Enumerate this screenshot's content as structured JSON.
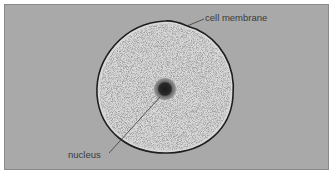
{
  "diagram": {
    "type": "labeled-cell",
    "background_color": "#a9a9a9",
    "cytoplasm_color": "#d8d8d8",
    "labels": {
      "membrane": "cell membrane",
      "nucleus": "nucleus"
    }
  }
}
